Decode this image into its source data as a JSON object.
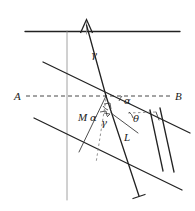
{
  "figure": {
    "background_color": "#ffffff",
    "ink_color": "#222222",
    "labels": {
      "point_a": "A",
      "point_b": "B",
      "gamma_upper": "γ",
      "alpha_upper": "α",
      "theta": "θ",
      "length_m": "M",
      "length_l": "L",
      "alpha_lower": "α",
      "gamma_lower": "γ"
    },
    "elements": {
      "surface_line": "horizontal-surface-line",
      "up_arrow": "upward-arrow-marker",
      "baseline_axis": "dashed-axis-a-b",
      "vertical_axis": "vertical-reference-line",
      "vertical_dashed": "vertical-dashed-drop-line",
      "parallel_upper": "upper-parallel-slant-line",
      "parallel_lower": "lower-parallel-slant-line",
      "incident_ray": "incident-ray",
      "refracted_ray": "refracted-ray",
      "ray_terminator": "ray-end-bar",
      "right_angle_marks": "right-angle-indicators",
      "angle_arcs": "angle-arc-marks"
    }
  }
}
